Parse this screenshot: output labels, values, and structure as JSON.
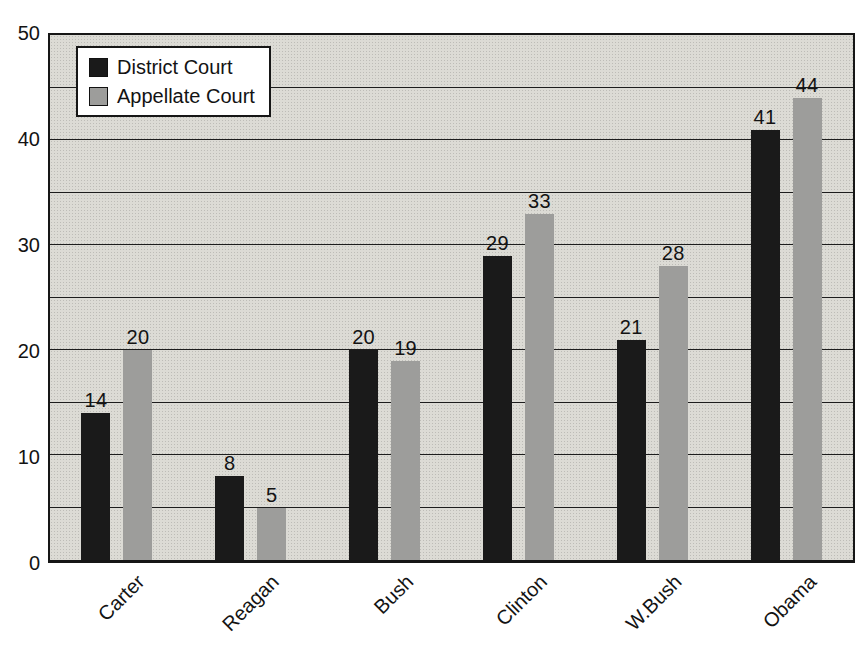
{
  "chart_data": {
    "type": "bar",
    "title": "",
    "xlabel": "",
    "ylabel": "",
    "categories": [
      "Carter",
      "Reagan",
      "Bush",
      "Clinton",
      "W.Bush",
      "Obama"
    ],
    "series": [
      {
        "name": "District Court",
        "color": "#1a1a1a",
        "values": [
          14,
          8,
          20,
          29,
          21,
          41
        ]
      },
      {
        "name": "Appellate Court",
        "color": "#9d9d9b",
        "values": [
          20,
          5,
          19,
          33,
          28,
          44
        ]
      }
    ],
    "ylim": [
      0,
      50
    ],
    "yticks": [
      0,
      10,
      20,
      30,
      40,
      50
    ],
    "grid_step": 5,
    "grid": true,
    "legend_position": "top-left",
    "bar_value_labels_shown": true
  },
  "colors": {
    "plot_background": "#dcdbd5",
    "grid_line": "#1d1d1d",
    "axis_border": "#161616",
    "page_background": "#ffffff",
    "text": "#131313"
  }
}
